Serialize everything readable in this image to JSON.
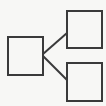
{
  "diagram": {
    "type": "tree",
    "background": "#f7f7f5",
    "stroke_color": "#3a3a3a",
    "stroke_width": 2,
    "nodes": [
      {
        "id": "root",
        "x": 8,
        "y": 37,
        "w": 35,
        "h": 38
      },
      {
        "id": "child-top",
        "x": 67,
        "y": 11,
        "w": 35,
        "h": 37
      },
      {
        "id": "child-bottom",
        "x": 67,
        "y": 63,
        "w": 35,
        "h": 38
      }
    ],
    "edges": [
      {
        "from": "root",
        "to": "child-top",
        "x1": 43,
        "y1": 54,
        "x2": 67,
        "y2": 33
      },
      {
        "from": "root",
        "to": "child-bottom",
        "x1": 43,
        "y1": 56,
        "x2": 67,
        "y2": 80
      }
    ]
  }
}
